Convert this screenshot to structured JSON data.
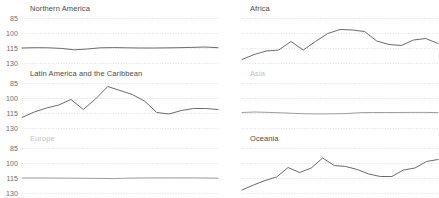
{
  "figure": {
    "width": 439,
    "height": 198,
    "background": "#ffffff",
    "line_color": "#6b6b6b",
    "muted_line_color": "#9f9f9f",
    "grid_color": "#c9c9c9",
    "tick_color": "#6d6d6d",
    "title_color": "#4a4a4a",
    "muted_title_color": "#c3c3c3"
  },
  "axes": {
    "y_ticks": [
      "130",
      "115",
      "100",
      "85"
    ],
    "x_ticks": [
      "2005",
      "2010",
      "2015",
      "2020"
    ]
  },
  "chart_data": {
    "type": "line",
    "title": "",
    "subtitle": "",
    "xlabel": "",
    "ylabel": "",
    "xlim": [
      2005,
      2020
    ],
    "ylim": [
      85,
      130
    ],
    "yticks": [
      85,
      100,
      115,
      130
    ],
    "xticks": [
      2005,
      2010,
      2015,
      2020
    ],
    "grid": "horizontal-dotted",
    "legend": "none",
    "layout": "small-multiples 2 columns x 3 rows",
    "x": [
      2005,
      2006,
      2007,
      2008,
      2009,
      2010,
      2011,
      2012,
      2013,
      2014,
      2015,
      2016,
      2017,
      2018,
      2019,
      2020
    ],
    "panels": [
      {
        "name": "northern-america",
        "title": "Northern America",
        "muted": false,
        "row": 0,
        "col": 0,
        "values": [
          100.0,
          100.3,
          100.2,
          99.6,
          98.2,
          99.0,
          100.2,
          100.4,
          100.2,
          100.0,
          100.0,
          100.1,
          100.3,
          100.6,
          101.0,
          100.3
        ]
      },
      {
        "name": "africa",
        "title": "Africa",
        "muted": false,
        "row": 0,
        "col": 1,
        "values": [
          88.5,
          93.5,
          97.0,
          98.0,
          106.5,
          98.0,
          106.5,
          114.5,
          118.5,
          118.0,
          116.5,
          107.0,
          103.5,
          102.5,
          108.0,
          109.5,
          104.5
        ]
      },
      {
        "name": "latin-america-and-the-caribbean",
        "title": "Latin America and the Caribbean",
        "muted": false,
        "row": 1,
        "col": 0,
        "values": [
          95.5,
          101.0,
          105.0,
          108.0,
          113.5,
          103.5,
          114.0,
          126.5,
          122.5,
          118.5,
          112.0,
          100.5,
          99.0,
          102.5,
          104.5,
          104.5,
          103.5
        ]
      },
      {
        "name": "asia",
        "title": "Asia",
        "muted": true,
        "row": 1,
        "col": 1,
        "values": [
          100.5,
          101.0,
          100.6,
          100.2,
          99.6,
          99.2,
          99.1,
          99.2,
          99.4,
          100.3,
          100.5,
          100.5,
          100.5,
          100.6,
          100.6,
          100.4
        ]
      },
      {
        "name": "europe",
        "title": "Europe",
        "muted": true,
        "row": 2,
        "col": 0,
        "values": [
          100.0,
          100.0,
          100.0,
          99.9,
          99.8,
          99.7,
          99.6,
          99.4,
          99.8,
          100.0,
          100.1,
          100.1,
          100.1,
          100.1,
          100.0,
          99.8
        ]
      },
      {
        "name": "oceania",
        "title": "Oceania",
        "muted": false,
        "row": 2,
        "col": 1,
        "values": [
          88.0,
          93.0,
          97.5,
          101.0,
          110.5,
          105.5,
          110.0,
          120.0,
          112.5,
          111.5,
          108.5,
          104.0,
          101.5,
          101.5,
          108.0,
          110.0,
          116.5,
          118.5
        ]
      }
    ]
  }
}
